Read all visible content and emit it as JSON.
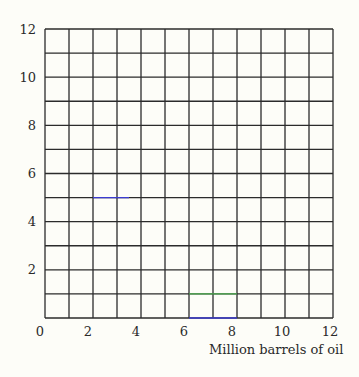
{
  "chart_data": {
    "type": "line",
    "title": "",
    "xlabel": "Million barrels of oil",
    "ylabel": "",
    "xlim": [
      0,
      12
    ],
    "ylim": [
      0,
      12
    ],
    "grid": true,
    "grid_step": 1,
    "x_ticks": [
      0,
      2,
      4,
      6,
      8,
      10,
      12
    ],
    "y_ticks": [
      2,
      4,
      6,
      8,
      10,
      12
    ],
    "x_tick_labels": [
      "0",
      "2",
      "4",
      "6",
      "8",
      "10",
      "12"
    ],
    "y_tick_labels": [
      "2",
      "4",
      "6",
      "8",
      "10",
      "12"
    ],
    "legend": null,
    "series": [
      {
        "name": "blue segment at y=5",
        "color": "#3b3bd0",
        "x": [
          2,
          3.5
        ],
        "y": [
          5,
          5
        ]
      },
      {
        "name": "green segment at y=1",
        "color": "#4caf50",
        "x": [
          6,
          8
        ],
        "y": [
          1,
          1
        ]
      },
      {
        "name": "blue segment at y=0",
        "color": "#3b3bd0",
        "x": [
          6,
          8
        ],
        "y": [
          0,
          0
        ]
      }
    ]
  },
  "labels": {
    "xlabel": "Million barrels of oil",
    "x_ticks": [
      "0",
      "2",
      "4",
      "6",
      "8",
      "10",
      "12"
    ],
    "y_ticks": [
      "2",
      "4",
      "6",
      "8",
      "10",
      "12"
    ]
  },
  "colors": {
    "grid": "#2b2b2b",
    "background": "#fdfdf8",
    "blue": "#3b3bd0",
    "green": "#4caf50"
  }
}
